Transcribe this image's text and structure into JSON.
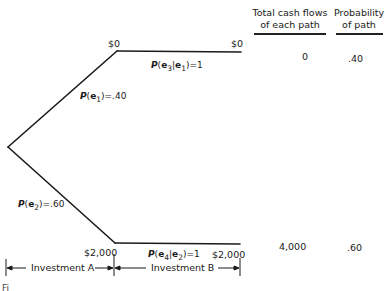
{
  "diagram": {
    "type": "decision-tree",
    "nodes": {
      "upper_start": "$0",
      "upper_end": "$0",
      "lower_start": "$2,000",
      "lower_end": "$2,000"
    },
    "branches": {
      "e1": {
        "label": "P(e₁)=.40",
        "prefix": "P",
        "event": "e",
        "sub": "1",
        "value": "=.40"
      },
      "e2": {
        "label": "P(e₂)=.60",
        "prefix": "P",
        "event": "e",
        "sub": "2",
        "value": "=.60"
      },
      "e3_given_e1": {
        "label": "P(e₃|e₁)=1",
        "prefix": "P",
        "event": "e",
        "sub": "3",
        "cond_sub": "1",
        "value": "=1"
      },
      "e4_given_e2": {
        "label": "P(e₄|e₂)=1",
        "prefix": "P",
        "event": "e",
        "sub": "4",
        "cond_sub": "2",
        "value": "=1"
      }
    },
    "columns": {
      "total_cash_flows": {
        "line1": "Total cash flows",
        "line2": "of each path"
      },
      "probability": {
        "line1": "Probability",
        "line2": "of path"
      }
    },
    "rows": [
      {
        "total": "0",
        "probability": ".40"
      },
      {
        "total": "4,000",
        "probability": ".60"
      }
    ],
    "periods": {
      "a": "Investment A",
      "b": "Investment B"
    },
    "caption_partial": "Fi"
  }
}
